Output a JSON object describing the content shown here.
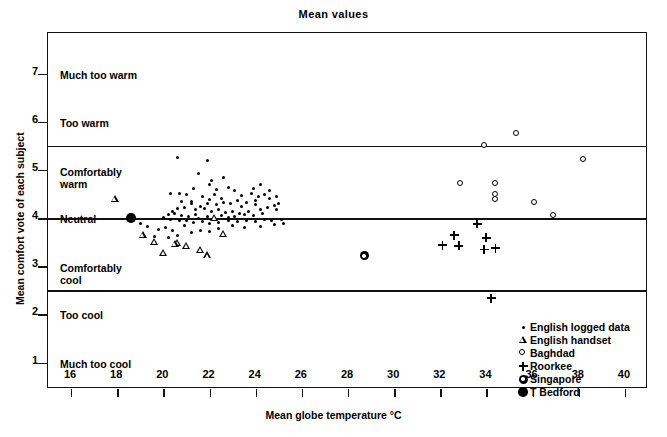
{
  "chart_data": {
    "type": "scatter",
    "title": "Mean values",
    "xlabel": "Mean globe temperature °C",
    "ylabel": "Mean comfort vote of each subject",
    "xlim": [
      15,
      41
    ],
    "ylim": [
      0.45,
      7.85
    ],
    "xticks": [
      16,
      18,
      20,
      22,
      24,
      26,
      28,
      30,
      32,
      34,
      36,
      38,
      40
    ],
    "yticks": [
      1,
      2,
      3,
      4,
      5,
      6,
      7
    ],
    "ycategories": [
      {
        "value": 7,
        "label": "Much too warm"
      },
      {
        "value": 6,
        "label": "Too warm"
      },
      {
        "value": 5,
        "label": "Comfortably\nwarm"
      },
      {
        "value": 4,
        "label": "Neutral"
      },
      {
        "value": 3,
        "label": "Comfortably\ncool"
      },
      {
        "value": 2,
        "label": "Too cool"
      },
      {
        "value": 1,
        "label": "Much too cool"
      }
    ],
    "hlines": [
      5.5,
      4.0,
      2.5
    ],
    "grid": false,
    "legend_position": "inside-bottom-right",
    "series": [
      {
        "name": "English logged data",
        "marker": "small-dot",
        "points": [
          [
            20.6,
            5.27
          ],
          [
            21.9,
            5.2
          ],
          [
            20.3,
            4.52
          ],
          [
            20.7,
            4.52
          ],
          [
            21.5,
            4.93
          ],
          [
            22.6,
            4.85
          ],
          [
            22.0,
            4.7
          ],
          [
            21.3,
            4.62
          ],
          [
            22.3,
            4.6
          ],
          [
            22.8,
            4.64
          ],
          [
            23.1,
            4.57
          ],
          [
            21.7,
            4.45
          ],
          [
            22.2,
            4.5
          ],
          [
            22.5,
            4.42
          ],
          [
            23.4,
            4.47
          ],
          [
            23.8,
            4.52
          ],
          [
            24.1,
            4.45
          ],
          [
            24.4,
            4.5
          ],
          [
            24.6,
            4.4
          ],
          [
            24.0,
            4.37
          ],
          [
            23.6,
            4.33
          ],
          [
            23.2,
            4.36
          ],
          [
            22.9,
            4.3
          ],
          [
            22.6,
            4.33
          ],
          [
            22.3,
            4.28
          ],
          [
            21.9,
            4.3
          ],
          [
            21.6,
            4.25
          ],
          [
            21.2,
            4.3
          ],
          [
            20.9,
            4.22
          ],
          [
            21.4,
            4.18
          ],
          [
            21.8,
            4.2
          ],
          [
            22.1,
            4.15
          ],
          [
            22.4,
            4.18
          ],
          [
            22.7,
            4.12
          ],
          [
            23.0,
            4.15
          ],
          [
            23.3,
            4.1
          ],
          [
            23.7,
            4.14
          ],
          [
            24.2,
            4.18
          ],
          [
            24.5,
            4.22
          ],
          [
            24.8,
            4.27
          ],
          [
            25.0,
            4.3
          ],
          [
            24.9,
            4.18
          ],
          [
            24.3,
            4.1
          ],
          [
            23.9,
            4.06
          ],
          [
            23.5,
            4.08
          ],
          [
            23.1,
            4.04
          ],
          [
            22.8,
            4.02
          ],
          [
            22.5,
            4.05
          ],
          [
            22.2,
            4.0
          ],
          [
            21.9,
            4.03
          ],
          [
            21.5,
            4.0
          ],
          [
            21.1,
            4.04
          ],
          [
            20.8,
            4.06
          ],
          [
            20.5,
            4.1
          ],
          [
            20.4,
            4.15
          ],
          [
            20.6,
            4.2
          ],
          [
            20.2,
            4.08
          ],
          [
            20.0,
            4.02
          ],
          [
            20.3,
            3.98
          ],
          [
            20.7,
            3.96
          ],
          [
            21.0,
            3.95
          ],
          [
            21.3,
            3.92
          ],
          [
            21.7,
            3.94
          ],
          [
            22.0,
            3.9
          ],
          [
            22.4,
            3.92
          ],
          [
            22.8,
            3.95
          ],
          [
            23.2,
            3.93
          ],
          [
            23.6,
            3.96
          ],
          [
            24.0,
            3.94
          ],
          [
            24.4,
            3.97
          ],
          [
            24.7,
            3.95
          ],
          [
            25.1,
            3.98
          ],
          [
            19.0,
            3.9
          ],
          [
            19.3,
            3.82
          ],
          [
            19.8,
            3.76
          ],
          [
            20.1,
            3.8
          ],
          [
            20.4,
            3.74
          ],
          [
            20.9,
            3.85
          ],
          [
            21.2,
            3.7
          ],
          [
            21.6,
            3.75
          ],
          [
            22.0,
            3.72
          ],
          [
            22.4,
            3.78
          ],
          [
            20.2,
            3.6
          ],
          [
            20.6,
            3.65
          ],
          [
            19.6,
            3.62
          ],
          [
            23.0,
            3.84
          ],
          [
            23.5,
            3.8
          ],
          [
            24.2,
            3.82
          ],
          [
            24.8,
            3.86
          ],
          [
            25.2,
            3.88
          ],
          [
            21.0,
            4.5
          ],
          [
            21.2,
            4.35
          ],
          [
            23.9,
            4.62
          ],
          [
            24.2,
            4.7
          ],
          [
            24.6,
            4.58
          ],
          [
            24.9,
            4.45
          ],
          [
            22.1,
            4.78
          ],
          [
            21.4,
            4.08
          ],
          [
            22.0,
            4.38
          ],
          [
            23.4,
            4.24
          ],
          [
            24.0,
            4.28
          ],
          [
            20.8,
            4.35
          ]
        ]
      },
      {
        "name": "English handset",
        "marker": "triangle-open",
        "points": [
          [
            17.9,
            4.4
          ],
          [
            19.1,
            3.72
          ],
          [
            19.6,
            3.64
          ],
          [
            20.0,
            3.47
          ],
          [
            20.6,
            3.74
          ],
          [
            20.5,
            3.78
          ],
          [
            21.0,
            3.8
          ],
          [
            22.2,
            4.45
          ],
          [
            22.6,
            4.18
          ],
          [
            21.6,
            3.9
          ],
          [
            21.9,
            3.85
          ]
        ]
      },
      {
        "name": "Baghdad",
        "marker": "circle-open",
        "points": [
          [
            33.9,
            5.5
          ],
          [
            35.3,
            5.75
          ],
          [
            38.2,
            5.22
          ],
          [
            32.9,
            4.72
          ],
          [
            34.4,
            4.72
          ],
          [
            34.4,
            4.5
          ],
          [
            34.4,
            4.38
          ],
          [
            36.1,
            4.32
          ],
          [
            36.9,
            4.05
          ]
        ]
      },
      {
        "name": "Roorkee",
        "marker": "plus",
        "points": [
          [
            32.1,
            4.12
          ],
          [
            32.6,
            4.42
          ],
          [
            32.8,
            4.3
          ],
          [
            33.6,
            4.85
          ],
          [
            34.0,
            4.65
          ],
          [
            33.9,
            4.5
          ],
          [
            34.4,
            4.62
          ],
          [
            34.2,
            3.68
          ]
        ]
      },
      {
        "name": "Singapore",
        "marker": "bullseye",
        "points": [
          [
            28.7,
            4.65
          ]
        ]
      },
      {
        "name": "T Bedford",
        "marker": "filled-circle",
        "points": [
          [
            18.6,
            4.0
          ]
        ]
      }
    ]
  },
  "legend": {
    "items": [
      {
        "label": "English logged data",
        "marker": "small-dot"
      },
      {
        "label": "English handset",
        "marker": "triangle-open"
      },
      {
        "label": "Baghdad",
        "marker": "circle-open"
      },
      {
        "label": "Roorkee",
        "marker": "plus"
      },
      {
        "label": "Singapore",
        "marker": "bullseye"
      },
      {
        "label": "T Bedford",
        "marker": "filled-circle"
      }
    ]
  },
  "colors": {
    "ink": "#111111",
    "background": "#ffffff"
  }
}
